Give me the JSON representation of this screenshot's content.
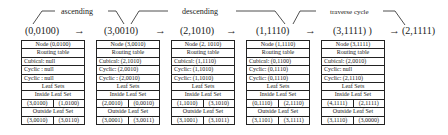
{
  "phases": [
    {
      "label": "ascending"
    },
    {
      "label": "descending"
    },
    {
      "label": "traverse cycle"
    }
  ],
  "path": [
    {
      "label": "(0,0100)"
    },
    {
      "label": "(3,0010)"
    },
    {
      "label": "(2,1010)"
    },
    {
      "label": "(1,1110)"
    },
    {
      "label": "(3,1111) )"
    },
    {
      "label": "(2,1111)"
    }
  ],
  "arrow_glyph": "→",
  "nodes": [
    {
      "title": "Node (0,0100)",
      "routing_header": "Routing table",
      "cubical": "Cubical: null",
      "cyclic1": "Cyclic : null",
      "cyclic2": "Cyclic : null",
      "leaf_header": "Leaf Sets",
      "inside_header": "Inside Leaf Set",
      "inside": [
        "(3,0100)",
        "(1,0100)"
      ],
      "outside_header": "Outside Leaf Set",
      "outside": [
        "(3,0010)",
        "(3,0110)"
      ]
    },
    {
      "title": "Node (3,0010)",
      "routing_header": "Routing table",
      "cubical": "Cubical: (2,1010)",
      "cyclic1": "Cyclic: (2,0010)",
      "cyclic2": "Cyclic : (2,0010)",
      "leaf_header": "Leaf Sets",
      "inside_header": "Inside Leaf Set",
      "inside": [
        "(2,0010)",
        "(0,0010)"
      ],
      "outside_header": "Outside Leaf Set",
      "outside": [
        "(3,0001)",
        "(3,0011)"
      ]
    },
    {
      "title": "Node (2, 1010)",
      "routing_header": "Routing table",
      "cubical": "Cubical: (1,1110)",
      "cyclic1": "Cyclic: (1,1010)",
      "cyclic2": "Cyclic: (1,1010)",
      "leaf_header": "Leaf Sets",
      "inside_header": "Inside Leaf Set",
      "inside": [
        "(1,1010)",
        "(3,1010)"
      ],
      "outside_header": "Outside Leaf Set",
      "outside": [
        "(3,1001)",
        "(3,1011)"
      ]
    },
    {
      "title": "Node (1,1110)",
      "routing_header": "Routing table",
      "cubical": "Cubical: (0,1100)",
      "cyclic1": "Cyclic: (0,1110)",
      "cyclic2": "Cyclic: (0,1110)",
      "leaf_header": "Leaf Sets",
      "inside_header": "Inside Leaf Set",
      "inside": [
        "(0,1110)",
        "(2,1110)"
      ],
      "outside_header": "Outside Leaf Set",
      "outside": [
        "(3,1101)",
        "(3,1111)"
      ]
    },
    {
      "title": "Node (3,1111)",
      "routing_header": "Routing table",
      "cubical": "Cubical: (2,0010)",
      "cyclic1": "Cyclic: null",
      "cyclic2": "Cyclic: (2,1110)",
      "leaf_header": "Leaf Sets",
      "inside_header": "Inside Leaf Set",
      "inside": [
        "(4,1111)",
        "(2,1111)"
      ],
      "outside_header": "Outside Leaf Set",
      "outside": [
        "(3,1110)",
        "(3,0000)"
      ]
    }
  ]
}
